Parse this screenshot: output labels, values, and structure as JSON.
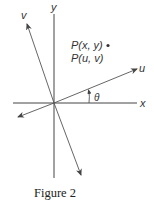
{
  "figure": {
    "caption": "Figure 2",
    "axes": {
      "x_label": "x",
      "y_label": "y"
    },
    "rotated_axes": {
      "u_label": "u",
      "v_label": "v",
      "angle_label": "θ"
    },
    "point": {
      "label_xy": "P(x, y)",
      "label_uv": "P(u, v)"
    },
    "colors": {
      "line": "#444444",
      "text": "#333333",
      "background": "#ffffff"
    }
  }
}
